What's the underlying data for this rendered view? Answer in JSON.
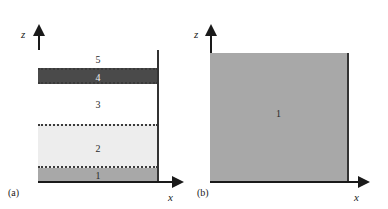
{
  "figure": {
    "panels": [
      {
        "caption": "(a)",
        "axis_z_label": "z",
        "axis_x_label": "x",
        "model": "layered",
        "layers": [
          {
            "id": "5",
            "label": "5",
            "color": "#ffffff",
            "top": 0,
            "height": 18
          },
          {
            "id": "4",
            "label": "4",
            "color": "#4a4a4a",
            "top": 18,
            "height": 16
          },
          {
            "id": "3",
            "label": "3",
            "color": "#ffffff",
            "top": 34,
            "height": 40
          },
          {
            "id": "2",
            "label": "2",
            "color": "#ededed",
            "top": 74,
            "height": 44
          },
          {
            "id": "1",
            "label": "1",
            "color": "#a8a8a8",
            "top": 118,
            "height": 13
          }
        ]
      },
      {
        "caption": "(b)",
        "axis_z_label": "z",
        "axis_x_label": "x",
        "model": "homogeneous-halfspace",
        "layers": [
          {
            "id": "1",
            "label": "1",
            "color": "#a8a8a8"
          }
        ]
      }
    ],
    "colors": {
      "axis": "#1a1a1a",
      "boundary_dotted": "#3a3a3a",
      "layer_dark": "#4a4a4a",
      "layer_light": "#ededed",
      "layer_medium": "#a8a8a8",
      "layer_white": "#ffffff",
      "background": "#ffffff"
    }
  }
}
